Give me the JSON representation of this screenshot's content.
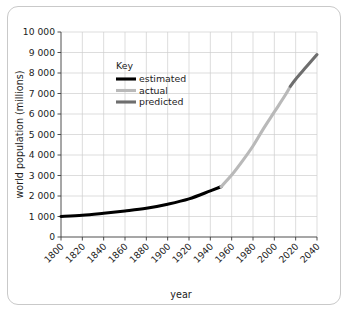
{
  "chart_data": {
    "type": "line",
    "title": "",
    "xlabel": "year",
    "ylabel": "world population (millions)",
    "xlim": [
      1800,
      2040
    ],
    "ylim": [
      0,
      10000
    ],
    "grid": true,
    "xticks": [
      "1800",
      "1820",
      "1840",
      "1860",
      "1880",
      "1900",
      "1920",
      "1940",
      "1960",
      "1980",
      "2000",
      "2020",
      "2040"
    ],
    "yticks": [
      "0",
      "1 000",
      "2 000",
      "3 000",
      "4 000",
      "5 000",
      "6 000",
      "7 000",
      "8 000",
      "9 000",
      "10 000"
    ],
    "legend": {
      "title": "Key",
      "position": "inside-upper-left",
      "entries": [
        {
          "name": "estimated",
          "color": "#000000"
        },
        {
          "name": "actual",
          "color": "#b9b9b9"
        },
        {
          "name": "predicted",
          "color": "#6e6e6e"
        }
      ]
    },
    "series": [
      {
        "name": "estimated",
        "color": "#000000",
        "x": [
          1800,
          1820,
          1840,
          1860,
          1880,
          1900,
          1920,
          1940,
          1950
        ],
        "values": [
          1000,
          1060,
          1160,
          1270,
          1400,
          1600,
          1860,
          2250,
          2450
        ]
      },
      {
        "name": "actual",
        "color": "#b9b9b9",
        "x": [
          1950,
          1960,
          1970,
          1980,
          1990,
          2000,
          2010,
          2015
        ],
        "values": [
          2450,
          3020,
          3700,
          4440,
          5300,
          6100,
          6900,
          7350
        ]
      },
      {
        "name": "predicted",
        "color": "#6e6e6e",
        "x": [
          2015,
          2020,
          2030,
          2040
        ],
        "values": [
          7350,
          7700,
          8300,
          8900
        ]
      }
    ]
  },
  "axis": {
    "x_title": "year",
    "y_title": "world population (millions)"
  }
}
